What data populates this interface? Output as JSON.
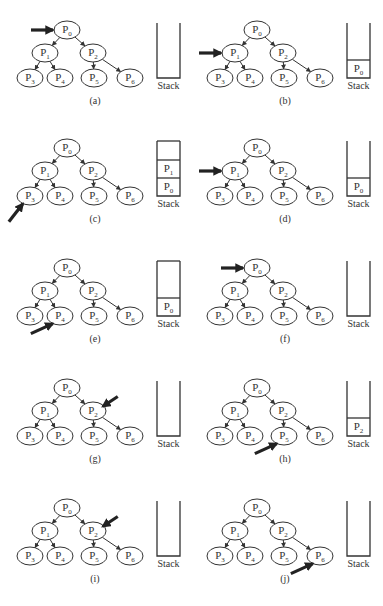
{
  "figure": {
    "tree": {
      "nodes": [
        {
          "id": "P0",
          "base": "P",
          "sub": "0",
          "x": 67,
          "y": 30
        },
        {
          "id": "P1",
          "base": "P",
          "sub": "1",
          "x": 45,
          "y": 53
        },
        {
          "id": "P2",
          "base": "P",
          "sub": "2",
          "x": 93,
          "y": 53
        },
        {
          "id": "P3",
          "base": "P",
          "sub": "3",
          "x": 30,
          "y": 78
        },
        {
          "id": "P4",
          "base": "P",
          "sub": "4",
          "x": 60,
          "y": 78
        },
        {
          "id": "P5",
          "base": "P",
          "sub": "5",
          "x": 94,
          "y": 78
        },
        {
          "id": "P6",
          "base": "P",
          "sub": "6",
          "x": 130,
          "y": 78
        }
      ],
      "edges": [
        [
          "P0",
          "P1"
        ],
        [
          "P0",
          "P2"
        ],
        [
          "P1",
          "P3"
        ],
        [
          "P1",
          "P4"
        ],
        [
          "P2",
          "P5"
        ],
        [
          "P2",
          "P6"
        ]
      ]
    },
    "stack_label": "Stack",
    "panels": [
      {
        "caption": "(a)",
        "ox": 0,
        "oy": 0,
        "pointer": {
          "node": "P0",
          "dir": "left"
        },
        "stack": {
          "closed": false,
          "items": []
        }
      },
      {
        "caption": "(b)",
        "ox": 190,
        "oy": 0,
        "pointer": {
          "node": "P1",
          "dir": "left"
        },
        "stack": {
          "closed": false,
          "items": [
            "P0"
          ]
        }
      },
      {
        "caption": "(c)",
        "ox": 0,
        "oy": 118,
        "pointer": {
          "node": "P3",
          "dir": "below-left"
        },
        "stack": {
          "closed": true,
          "items": [
            "P0",
            "P1"
          ],
          "empty_top": true
        }
      },
      {
        "caption": "(d)",
        "ox": 190,
        "oy": 118,
        "pointer": {
          "node": "P1",
          "dir": "left"
        },
        "stack": {
          "closed": false,
          "items": [
            "P0"
          ]
        }
      },
      {
        "caption": "(e)",
        "ox": 0,
        "oy": 238,
        "pointer": {
          "node": "P4",
          "dir": "below-left"
        },
        "stack": {
          "closed": true,
          "items": [
            "P0"
          ],
          "empty_top": true
        }
      },
      {
        "caption": "(f)",
        "ox": 190,
        "oy": 238,
        "pointer": {
          "node": "P0",
          "dir": "left"
        },
        "stack": {
          "closed": false,
          "items": []
        }
      },
      {
        "caption": "(g)",
        "ox": 0,
        "oy": 358,
        "pointer": {
          "node": "P2",
          "dir": "upper-right"
        },
        "stack": {
          "closed": false,
          "items": []
        }
      },
      {
        "caption": "(h)",
        "ox": 190,
        "oy": 358,
        "pointer": {
          "node": "P5",
          "dir": "below-left"
        },
        "stack": {
          "closed": false,
          "items": [
            "P2"
          ]
        }
      },
      {
        "caption": "(i)",
        "ox": 0,
        "oy": 478,
        "pointer": {
          "node": "P2",
          "dir": "upper-right"
        },
        "stack": {
          "closed": false,
          "items": []
        }
      },
      {
        "caption": "(j)",
        "ox": 190,
        "oy": 478,
        "pointer": {
          "node": "P6",
          "dir": "below-left"
        },
        "stack": {
          "closed": false,
          "items": []
        }
      }
    ],
    "colors": {
      "stroke": "#333333",
      "pointer": "#222222",
      "background": "#ffffff"
    }
  }
}
